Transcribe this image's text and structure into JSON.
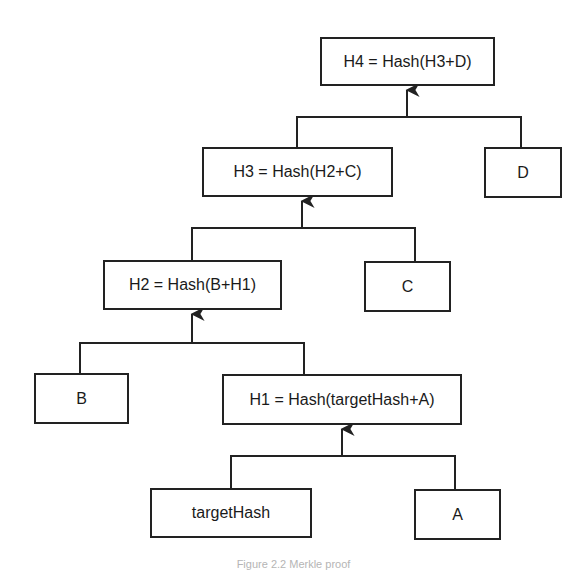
{
  "diagram": {
    "type": "tree",
    "nodes": {
      "h4": {
        "label": "H4 = Hash(H3+D)"
      },
      "h3": {
        "label": "H3 = Hash(H2+C)"
      },
      "d": {
        "label": "D"
      },
      "h2": {
        "label": "H2 = Hash(B+H1)"
      },
      "c": {
        "label": "C"
      },
      "b": {
        "label": "B"
      },
      "h1": {
        "label": "H1 = Hash(targetHash+A)"
      },
      "target": {
        "label": "targetHash"
      },
      "a": {
        "label": "A"
      }
    },
    "edges": [
      {
        "from": "h3",
        "to": "h4"
      },
      {
        "from": "d",
        "to": "h4"
      },
      {
        "from": "h2",
        "to": "h3"
      },
      {
        "from": "c",
        "to": "h3"
      },
      {
        "from": "b",
        "to": "h2"
      },
      {
        "from": "h1",
        "to": "h2"
      },
      {
        "from": "target",
        "to": "h1"
      },
      {
        "from": "a",
        "to": "h1"
      }
    ],
    "caption": "Figure 2.2 Merkle proof"
  }
}
